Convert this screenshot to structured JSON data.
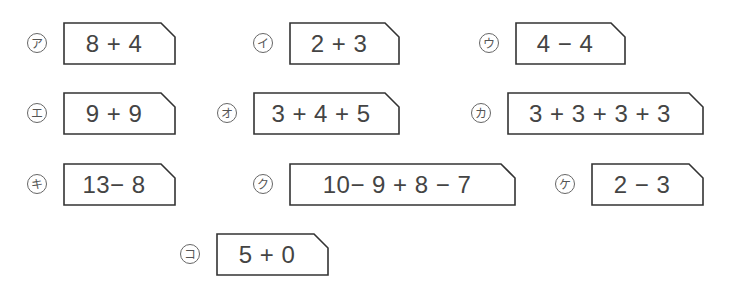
{
  "problems": [
    {
      "label": "ア",
      "expression": "8 + 4",
      "x": 27,
      "y": 22,
      "width": 112
    },
    {
      "label": "イ",
      "expression": "2 + 3",
      "x": 253,
      "y": 22,
      "width": 110
    },
    {
      "label": "ウ",
      "expression": "4 − 4",
      "x": 479,
      "y": 22,
      "width": 110
    },
    {
      "label": "エ",
      "expression": "9 + 9",
      "x": 27,
      "y": 92,
      "width": 112
    },
    {
      "label": "オ",
      "expression": "3 + 4 + 5",
      "x": 217,
      "y": 92,
      "width": 146
    },
    {
      "label": "カ",
      "expression": "3 + 3 + 3 + 3",
      "x": 471,
      "y": 92,
      "width": 196
    },
    {
      "label": "キ",
      "expression": "13− 8",
      "x": 27,
      "y": 163,
      "width": 112
    },
    {
      "label": "ク",
      "expression": "10− 9 + 8 − 7",
      "x": 253,
      "y": 163,
      "width": 226
    },
    {
      "label": "ケ",
      "expression": "2 − 3",
      "x": 555,
      "y": 163,
      "width": 112
    },
    {
      "label": "コ",
      "expression": "5 + 0",
      "x": 180,
      "y": 233,
      "width": 112
    }
  ]
}
